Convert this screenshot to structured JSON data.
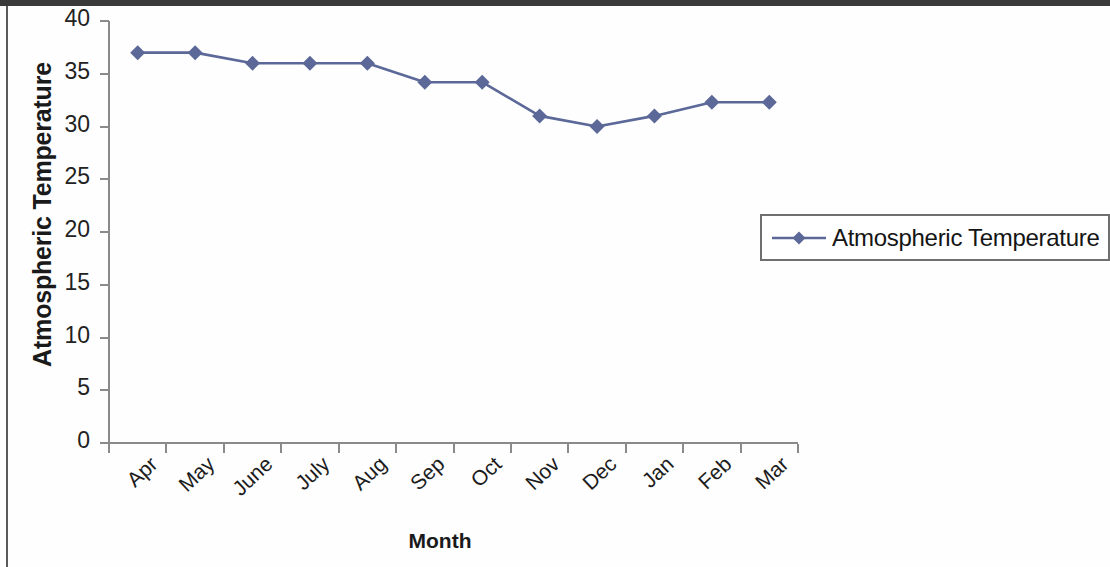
{
  "chart_data": {
    "type": "line",
    "title": "",
    "xlabel": "Month",
    "ylabel": "Atmospheric Temperature",
    "categories": [
      "Apr",
      "May",
      "June",
      "July",
      "Aug",
      "Sep",
      "Oct",
      "Nov",
      "Dec",
      "Jan",
      "Feb",
      "Mar"
    ],
    "series": [
      {
        "name": "Atmospheric Temperature",
        "values": [
          37,
          37,
          36,
          36,
          36,
          34.2,
          34.2,
          31,
          30,
          31,
          32.3,
          32.3
        ],
        "color": "#5b6898",
        "marker": "diamond"
      }
    ],
    "ylim": [
      0,
      40
    ],
    "ytick_values": [
      0,
      5,
      10,
      15,
      20,
      25,
      30,
      35,
      40
    ],
    "ytick_labels": [
      "0",
      "5",
      "10",
      "15",
      "20",
      "25",
      "30",
      "35",
      "40"
    ],
    "grid": false,
    "legend_position": "right"
  },
  "legend": {
    "entries": [
      {
        "label": "Atmospheric Temperature",
        "color": "#5b6898"
      }
    ]
  },
  "axis_titles": {
    "x": "Month",
    "y": "Atmospheric Temperature"
  },
  "colors": {
    "series": "#5b6898",
    "axis": "#8a8a8a",
    "text": "#1a1a1a",
    "legend_border": "#6f6f6f",
    "page_frame": "#3a3a3a"
  }
}
